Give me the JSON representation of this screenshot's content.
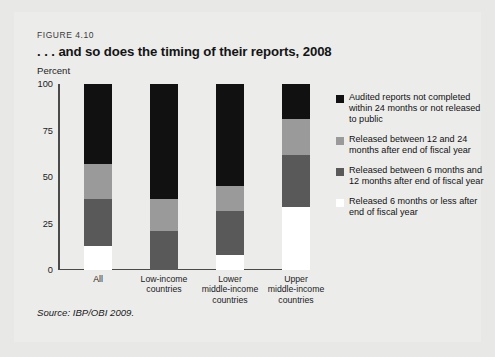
{
  "figure": {
    "number_label": "FIGURE 4.10",
    "title": ". . . and so does the timing of their reports, 2008",
    "axis_unit": "Percent",
    "source": "Source: IBP/OBI 2009."
  },
  "legend": {
    "items": [
      {
        "swatch": "black",
        "color": "#111111",
        "label": "Audited reports not completed within 24 months or not released to public"
      },
      {
        "swatch": "light",
        "color": "#9a9a9a",
        "label": "Released between 12 and 24 months after end of fiscal year"
      },
      {
        "swatch": "dark",
        "color": "#595959",
        "label": "Released between 6 months and 12 months after end of fiscal year"
      },
      {
        "swatch": "white",
        "color": "#ffffff",
        "label": "Released 6 months or less after end of fiscal year"
      }
    ]
  },
  "chart_data": {
    "type": "bar",
    "stacked": true,
    "title": ". . . and so does the timing of their reports, 2008",
    "xlabel": "",
    "ylabel": "Percent",
    "ylim": [
      0,
      100
    ],
    "yticks": [
      0,
      25,
      50,
      75,
      100
    ],
    "ytick_labels": [
      "0",
      "25",
      "50",
      "75",
      "100"
    ],
    "grid": false,
    "legend_position": "right",
    "categories": [
      "All",
      "Low-income countries",
      "Lower middle-income countries",
      "Upper middle-income countries"
    ],
    "series": [
      {
        "name": "Released 6 months or less after end of fiscal year",
        "color": "#ffffff",
        "values": [
          13,
          0,
          8,
          34
        ]
      },
      {
        "name": "Released between 6 months and 12 months after end of fiscal year",
        "color": "#595959",
        "values": [
          25,
          21,
          24,
          28
        ]
      },
      {
        "name": "Released between 12 and 24 months after end of fiscal year",
        "color": "#9a9a9a",
        "values": [
          19,
          17,
          13,
          19
        ]
      },
      {
        "name": "Audited reports not completed within 24 months or not released to public",
        "color": "#111111",
        "values": [
          43,
          62,
          55,
          19
        ]
      }
    ]
  },
  "x_axis": {
    "labels": [
      {
        "line1": "All",
        "line2": "",
        "line3": ""
      },
      {
        "line1": "Low-income",
        "line2": "countries",
        "line3": ""
      },
      {
        "line1": "Lower",
        "line2": "middle-income",
        "line3": "countries"
      },
      {
        "line1": "Upper",
        "line2": "middle-income",
        "line3": "countries"
      }
    ]
  }
}
